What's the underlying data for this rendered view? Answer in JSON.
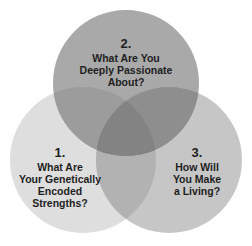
{
  "diagram": {
    "type": "venn",
    "circles": [
      {
        "id": "top",
        "number": "2.",
        "text": [
          "What Are You",
          "Deeply Passionate",
          "About?"
        ],
        "color": "#a9a9a9"
      },
      {
        "id": "left",
        "number": "1.",
        "text": [
          "What Are",
          "Your Genetically",
          "Encoded",
          "Strengths?"
        ],
        "color": "#dedede"
      },
      {
        "id": "right",
        "number": "3.",
        "text": [
          "How Will",
          "You Make",
          "a Living?"
        ],
        "color": "#c6c6c6"
      }
    ],
    "overlap_colors": {
      "top_left": "#9a9a9a",
      "top_right": "#8c8c8c",
      "left_right": "#b0b0b0",
      "center": "#808080"
    }
  }
}
